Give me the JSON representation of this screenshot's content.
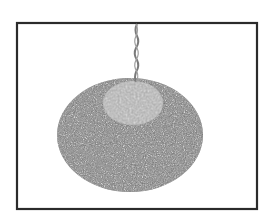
{
  "image": {
    "description": "Photo of a round bird seed ball hanging from a twisted wire, inside a dark rectangular frame",
    "subject": "seed-ball",
    "colors": {
      "background": "#ffffff",
      "frame": "#2b2b2b",
      "seed_dark": "#6f6f6f",
      "seed_light": "#bdbdbd",
      "center_patch": "#a9a9a9",
      "wire": "#7a7a7a"
    }
  }
}
